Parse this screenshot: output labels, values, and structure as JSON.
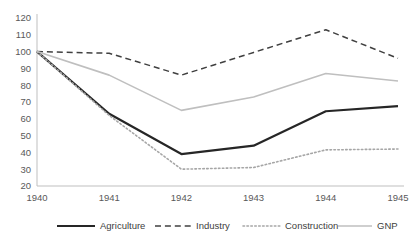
{
  "chart_data": {
    "type": "line",
    "title": "",
    "subtitle": "",
    "xlabel": "",
    "ylabel": "",
    "categories": [
      "1940",
      "1941",
      "1942",
      "1943",
      "1944",
      "1945"
    ],
    "x": [
      1940,
      1941,
      1942,
      1943,
      1944,
      1945
    ],
    "ylim": [
      20,
      120
    ],
    "yticks": [
      20,
      30,
      40,
      50,
      60,
      70,
      80,
      90,
      100,
      110,
      120
    ],
    "ytick_labels": [
      "20",
      "30",
      "40",
      "50",
      "60",
      "70",
      "80",
      "90",
      "100",
      "110",
      "120"
    ],
    "grid": false,
    "legend_position": "bottom",
    "series": [
      {
        "name": "Agriculture",
        "values": [
          100,
          63,
          39,
          44,
          64.5,
          67.5
        ],
        "color": "#262626",
        "style": "solid",
        "width": 2.2
      },
      {
        "name": "Industry",
        "values": [
          100,
          99,
          86,
          99.5,
          113,
          96
        ],
        "color": "#404040",
        "style": "dashed",
        "width": 1.5
      },
      {
        "name": "Construction",
        "values": [
          100,
          62,
          30,
          31,
          41.5,
          42
        ],
        "color": "#a6a6a6",
        "style": "dotted",
        "width": 1.6
      },
      {
        "name": "GNP",
        "values": [
          100,
          86,
          65,
          73,
          87,
          82.5
        ],
        "color": "#bfbfbf",
        "style": "solid",
        "width": 1.6
      }
    ]
  },
  "axes": {
    "y_axis_color": "#bfbfbf",
    "x_axis_color": "#bfbfbf"
  },
  "legend": {
    "entries": [
      {
        "label": "Agriculture"
      },
      {
        "label": "Industry"
      },
      {
        "label": "Construction"
      },
      {
        "label": "GNP"
      }
    ]
  }
}
